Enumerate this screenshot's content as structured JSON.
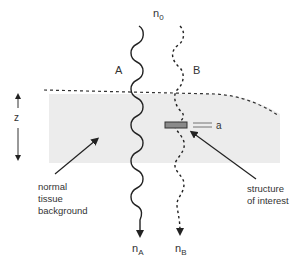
{
  "diagram": {
    "labels": {
      "n0_main": "n",
      "n0_sub": "0",
      "ray_a": "A",
      "ray_b": "B",
      "z_axis": "z",
      "thickness": "a",
      "nA_main": "n",
      "nA_sub": "A",
      "nB_main": "n",
      "nB_sub": "B",
      "background_line1": "normal",
      "background_line2": "tissue",
      "background_line3": "background",
      "structure_line1": "structure",
      "structure_line2": "of interest"
    },
    "colors": {
      "tissue_fill": "#ececec",
      "line": "#222222",
      "structure_fill": "#8a8a8a",
      "text": "#333333"
    }
  }
}
